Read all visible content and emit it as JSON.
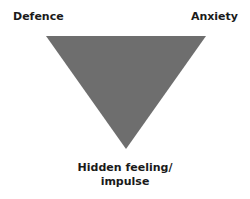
{
  "diagram": {
    "type": "triangle-of-conflict",
    "labels": {
      "top_left": "Defence",
      "top_right": "Anxiety",
      "bottom_line1": "Hidden feeling/",
      "bottom_line2": "impulse"
    },
    "colors": {
      "triangle_fill": "#6e6e6e",
      "text": "#1a1a1a"
    }
  }
}
